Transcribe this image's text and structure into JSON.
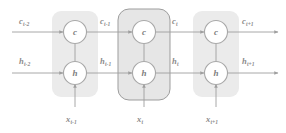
{
  "diagram": {
    "type": "lstm-unrolled-cell-diagram",
    "title": "",
    "colors": {
      "block_fill": "#ebebeb",
      "highlight_block_fill": "#e4e4e4",
      "highlight_block_stroke": "#9a9a9a",
      "node_fill": "#ffffff",
      "node_stroke": "#a8a8a8",
      "arrow": "#9e9e9e",
      "text": "#8a8a8a",
      "background": "#ffffff"
    },
    "blocks": [
      {
        "id": "block-t-minus-1",
        "highlighted": false,
        "x": 52,
        "y": 11,
        "w": 46,
        "h": 86
      },
      {
        "id": "block-t",
        "highlighted": true,
        "x": 118,
        "y": 9,
        "w": 52,
        "h": 91
      },
      {
        "id": "block-t-plus-1",
        "highlighted": false,
        "x": 193,
        "y": 11,
        "w": 46,
        "h": 86
      }
    ],
    "nodes": [
      {
        "id": "c-node-t-minus-1",
        "letter": "c",
        "cx": 75,
        "cy": 32
      },
      {
        "id": "h-node-t-minus-1",
        "letter": "h",
        "cx": 75,
        "cy": 73
      },
      {
        "id": "c-node-t",
        "letter": "c",
        "cx": 144,
        "cy": 32
      },
      {
        "id": "h-node-t",
        "letter": "h",
        "cx": 144,
        "cy": 73
      },
      {
        "id": "c-node-t-plus-1",
        "letter": "c",
        "cx": 216,
        "cy": 32
      },
      {
        "id": "h-node-t-plus-1",
        "letter": "h",
        "cx": 216,
        "cy": 73
      }
    ],
    "cell_state_labels": [
      {
        "id": "c-label-t-minus-2",
        "base": "c",
        "sub": "t-2",
        "x": 19,
        "y": 17
      },
      {
        "id": "c-label-t-minus-1",
        "base": "c",
        "sub": "t-1",
        "x": 100,
        "y": 17
      },
      {
        "id": "c-label-t",
        "base": "c",
        "sub": "t",
        "x": 172,
        "y": 17
      },
      {
        "id": "c-label-t-plus-1",
        "base": "c",
        "sub": "t+1",
        "x": 242,
        "y": 17
      }
    ],
    "hidden_state_labels": [
      {
        "id": "h-label-t-minus-2",
        "base": "h",
        "sub": "t-2",
        "x": 19,
        "y": 57
      },
      {
        "id": "h-label-t-minus-1",
        "base": "h",
        "sub": "t-1",
        "x": 100,
        "y": 57
      },
      {
        "id": "h-label-t",
        "base": "h",
        "sub": "t",
        "x": 172,
        "y": 57
      },
      {
        "id": "h-label-t-plus-1",
        "base": "h",
        "sub": "t+1",
        "x": 242,
        "y": 57
      }
    ],
    "input_labels": [
      {
        "id": "x-label-t-minus-1",
        "base": "x",
        "sub": "t-1",
        "x": 66,
        "y": 115
      },
      {
        "id": "x-label-t",
        "base": "x",
        "sub": "t",
        "x": 137,
        "y": 115
      },
      {
        "id": "x-label-t-plus-1",
        "base": "x",
        "sub": "t+1",
        "x": 206,
        "y": 115
      }
    ],
    "edges": {
      "cell_row_y": 32,
      "hidden_row_y": 73,
      "input_arrow_start_y": 107,
      "row_start_x": 12,
      "row_end_x": 278
    }
  }
}
